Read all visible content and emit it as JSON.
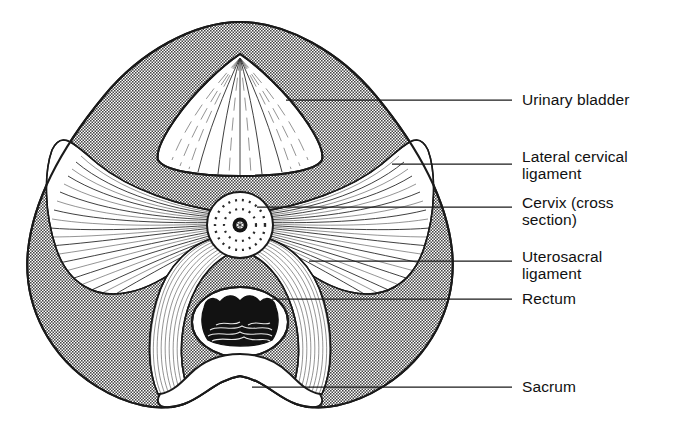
{
  "figure": {
    "kind": "anatomical-diagram",
    "orientation": "transverse / superior view",
    "background_color": "#ffffff",
    "ink_color": "#1a1a1a",
    "shaded_fill_color": "#9a9a9a",
    "shaded_pattern": "halftone-stipple",
    "white_fill_color": "#ffffff"
  },
  "labels": [
    {
      "id": "urinary-bladder",
      "lines": [
        "Urinary bladder"
      ],
      "text_x": 522,
      "text_y": 105,
      "leader": {
        "x1": 286,
        "y1": 100,
        "x2": 512,
        "y2": 100
      }
    },
    {
      "id": "lateral-cervical-ligament",
      "lines": [
        "Lateral cervical",
        "ligament"
      ],
      "text_x": 522,
      "text_y": 162,
      "leader": {
        "x1": 392,
        "y1": 164,
        "x2": 512,
        "y2": 164
      }
    },
    {
      "id": "cervix-cross-section",
      "lines": [
        "Cervix (cross",
        "section)"
      ],
      "text_x": 522,
      "text_y": 208,
      "leader": {
        "x1": 257,
        "y1": 207,
        "x2": 512,
        "y2": 207
      }
    },
    {
      "id": "uterosacral-ligament",
      "lines": [
        "Uterosacral",
        "ligament"
      ],
      "text_x": 522,
      "text_y": 262,
      "leader": {
        "x1": 309,
        "y1": 261,
        "x2": 512,
        "y2": 261
      }
    },
    {
      "id": "rectum",
      "lines": [
        "Rectum"
      ],
      "text_x": 522,
      "text_y": 304,
      "leader": {
        "x1": 272,
        "y1": 299,
        "x2": 512,
        "y2": 299
      }
    },
    {
      "id": "sacrum",
      "lines": [
        "Sacrum"
      ],
      "text_x": 522,
      "text_y": 392,
      "leader": {
        "x1": 252,
        "y1": 387,
        "x2": 512,
        "y2": 387
      }
    }
  ],
  "structures": [
    {
      "id": "pelvic-outline",
      "name": "Pelvic cavity outline",
      "shape": "heart"
    },
    {
      "id": "urinary-bladder-body",
      "name": "Urinary bladder",
      "fill": "white",
      "detail": "radiating mucosal folds"
    },
    {
      "id": "lateral-cervical-ligament-left",
      "name": "Lateral cervical ligament (left)",
      "fill": "white",
      "detail": "fanned fibrous striations"
    },
    {
      "id": "lateral-cervical-ligament-right",
      "name": "Lateral cervical ligament (right)",
      "fill": "white",
      "detail": "fanned fibrous striations"
    },
    {
      "id": "cervix-body",
      "name": "Cervix (cross section)",
      "fill": "white",
      "detail": "concentric dotted rings with dark canal"
    },
    {
      "id": "uterosacral-ligament-left",
      "name": "Uterosacral ligament (left)",
      "fill": "white",
      "detail": "curved striated band"
    },
    {
      "id": "uterosacral-ligament-right",
      "name": "Uterosacral ligament (right)",
      "fill": "white",
      "detail": "curved striated band"
    },
    {
      "id": "rectum-body",
      "name": "Rectum",
      "fill": "white",
      "detail": "dark lumen with mucosal contents"
    },
    {
      "id": "sacrum-body",
      "name": "Sacrum",
      "fill": "white",
      "detail": "smooth bony prominence"
    }
  ]
}
